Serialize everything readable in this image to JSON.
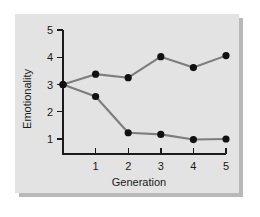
{
  "figure": {
    "panel_background": "#e3e3e3",
    "page_background": "#ffffff",
    "shadow_color": "#b9b9b9"
  },
  "chart_data": {
    "type": "line",
    "title": "",
    "subtitle": "",
    "xlabel": "Generation",
    "ylabel": "Emotionality",
    "x": [
      0,
      1,
      2,
      3,
      4,
      5
    ],
    "xlim": [
      0,
      5
    ],
    "ylim": [
      0.45,
      5
    ],
    "xticks": [
      1,
      2,
      3,
      4,
      5
    ],
    "xticklabels": [
      "1",
      "2",
      "3",
      "4",
      "5"
    ],
    "yticks": [
      1,
      2,
      3,
      4,
      5
    ],
    "yticklabels": [
      "1",
      "2",
      "3",
      "4",
      "5"
    ],
    "grid": false,
    "legend": "none",
    "line_color": "#7d7d7d",
    "marker_color": "#111111",
    "marker_radius": 3.6,
    "series": [
      {
        "name": "High-emotionality line",
        "values": [
          3.0,
          3.38,
          3.25,
          4.02,
          3.62,
          4.06
        ],
        "color": "#7d7d7d"
      },
      {
        "name": "Low-emotionality line",
        "values": [
          3.0,
          2.56,
          1.23,
          1.17,
          0.98,
          1.0
        ],
        "color": "#7d7d7d"
      }
    ],
    "annotations": []
  }
}
